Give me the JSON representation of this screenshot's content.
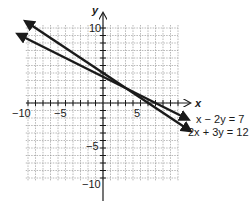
{
  "chart_data": {
    "type": "line",
    "title": "",
    "xlabel": "x",
    "ylabel": "y",
    "xlim": [
      -10,
      10
    ],
    "ylim": [
      -10,
      10
    ],
    "grid": true,
    "x_tick_labels": [
      "-10",
      "-5",
      "5"
    ],
    "y_tick_labels": [
      "10",
      "-5",
      "-10"
    ],
    "series": [
      {
        "name": "x − 2y = 7",
        "equation_label": "x − 2y = 7",
        "points": [
          [
            -11,
            9
          ],
          [
            11,
            -2
          ]
        ]
      },
      {
        "name": "2x + 3y = 12",
        "equation_label": "2x + 3y = 12",
        "points": [
          [
            -10,
            10.67
          ],
          [
            11.3,
            -3.5
          ]
        ]
      }
    ],
    "legend_position": "right, next to line ends"
  },
  "axes": {
    "x_label": "x",
    "y_label": "y",
    "ticks": {
      "x_neg10": "−10",
      "x_neg5": "−5",
      "x_5": "5",
      "y_10": "10",
      "y_neg5": "−5",
      "y_neg10": "−10"
    }
  },
  "labels": {
    "line1": "x − 2y = 7",
    "line2": "2x + 3y = 12"
  },
  "colors": {
    "line": "#1a1a1a",
    "grid": "#8a8a8a",
    "axis": "#1a1a1a"
  }
}
